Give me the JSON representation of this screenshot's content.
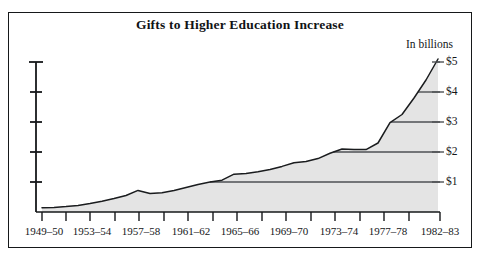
{
  "chart_data": {
    "type": "area",
    "title": "Gifts to Higher Education Increase",
    "unit_note": "In billions",
    "xlabel": "",
    "ylabel": "",
    "ylim": [
      0,
      5.3
    ],
    "grid": true,
    "legend_position": "none",
    "y_ticks": [
      {
        "label": "$1",
        "value": 1
      },
      {
        "label": "$2",
        "value": 2
      },
      {
        "label": "$3",
        "value": 3
      },
      {
        "label": "$4",
        "value": 4
      },
      {
        "label": "$5",
        "value": 5
      }
    ],
    "x_tick_labels": [
      "1949–50",
      "1953–54",
      "1957–58",
      "1961–62",
      "1965–66",
      "1969–70",
      "1973–74",
      "1977–78",
      "1982–83"
    ],
    "series": [
      {
        "name": "Gifts to higher education",
        "x": [
          "1949-50",
          "1950-51",
          "1951-52",
          "1952-53",
          "1953-54",
          "1954-55",
          "1955-56",
          "1956-57",
          "1957-58",
          "1958-59",
          "1959-60",
          "1960-61",
          "1961-62",
          "1962-63",
          "1963-64",
          "1964-65",
          "1965-66",
          "1966-67",
          "1967-68",
          "1968-69",
          "1969-70",
          "1970-71",
          "1971-72",
          "1972-73",
          "1973-74",
          "1974-75",
          "1975-76",
          "1976-77",
          "1977-78",
          "1978-79",
          "1979-80",
          "1980-81",
          "1981-82",
          "1982-83"
        ],
        "values": [
          0.14,
          0.15,
          0.18,
          0.22,
          0.28,
          0.36,
          0.45,
          0.55,
          0.72,
          0.62,
          0.64,
          0.72,
          0.82,
          0.92,
          1.0,
          1.06,
          1.26,
          1.28,
          1.34,
          1.42,
          1.52,
          1.64,
          1.68,
          1.78,
          1.96,
          2.1,
          2.08,
          2.08,
          2.3,
          2.98,
          3.25,
          3.8,
          4.4,
          5.1
        ]
      }
    ],
    "colors": {
      "area_fill": "#e4e4e4",
      "line": "#1a1c1e",
      "gridline": "#4e5154",
      "axis": "#16181a",
      "text": "#141618",
      "background": "#ffffff"
    }
  }
}
